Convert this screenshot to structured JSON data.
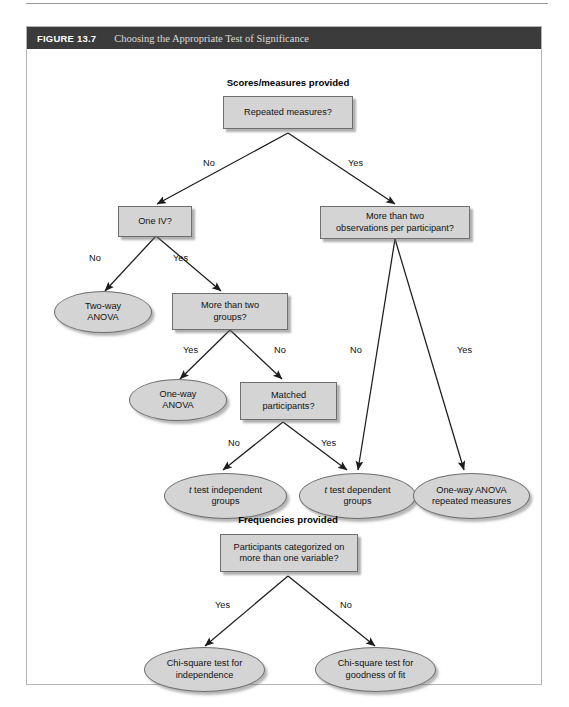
{
  "figure": {
    "label": "FIGURE 13.7",
    "title": "Choosing the Appropriate Test of Significance"
  },
  "sections": [
    {
      "id": "scores",
      "title": "Scores/measures provided"
    },
    {
      "id": "frequencies",
      "title": "Frequencies provided"
    }
  ],
  "nodes": {
    "repeated_measures": "Repeated measures?",
    "one_iv": "One IV?",
    "more_than_two_obs_line1": "More than two",
    "more_than_two_obs_line2": "observations per participant?",
    "two_way_anova_line1": "Two-way",
    "two_way_anova_line2": "ANOVA",
    "more_than_two_groups_line1": "More than two",
    "more_than_two_groups_line2": "groups?",
    "one_way_anova_line1": "One-way",
    "one_way_anova_line2": "ANOVA",
    "matched_participants_line1": "Matched",
    "matched_participants_line2": "participants?",
    "t_test_independent_line1_italic": "t",
    "t_test_independent_line1_rest": " test independent",
    "t_test_independent_line2": "groups",
    "t_test_dependent_line1_italic": "t",
    "t_test_dependent_line1_rest": " test dependent",
    "t_test_dependent_line2": "groups",
    "one_way_anova_rm_line1": "One-way ANOVA",
    "one_way_anova_rm_line2": "repeated measures",
    "participants_categorized_line1": "Participants categorized on",
    "participants_categorized_line2": "more than one variable?",
    "chi_square_independence_line1": "Chi-square test for",
    "chi_square_independence_line2": "independence",
    "chi_square_goodness_line1": "Chi-square test for",
    "chi_square_goodness_line2": "goodness of fit"
  },
  "edge_labels": {
    "rm_no": "No",
    "rm_yes": "Yes",
    "oneiv_no": "No",
    "oneiv_yes": "Yes",
    "groups_yes": "Yes",
    "groups_no": "No",
    "matched_no": "No",
    "matched_yes": "Yes",
    "obs_no": "No",
    "obs_yes": "Yes",
    "cat_yes": "Yes",
    "cat_no": "No"
  },
  "colors": {
    "header_bg": "#3b3b3b",
    "node_fill": "#d4d4d4",
    "node_stroke": "#6e6e6e",
    "frame_border": "#b4b4b4",
    "text": "#111111"
  }
}
